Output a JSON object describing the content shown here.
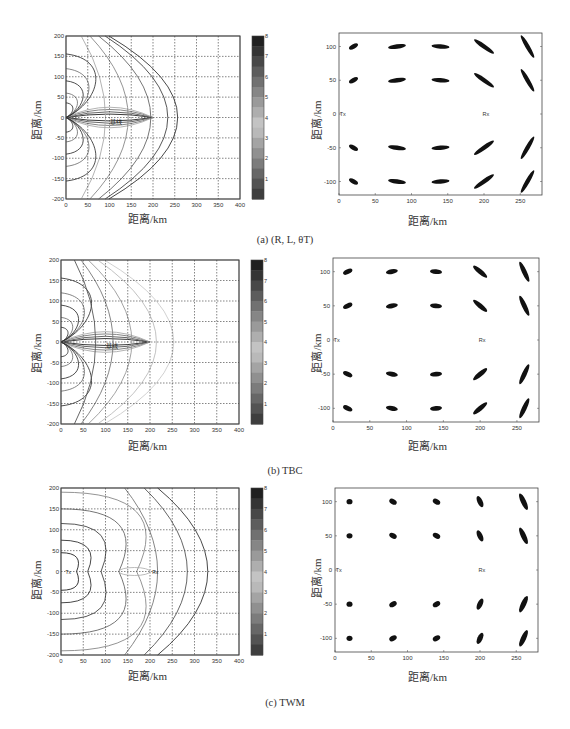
{
  "figure": {
    "rows": [
      {
        "caption": "(a) (R, L, θT)",
        "contour": {
          "xlabel": "距离/km",
          "ylabel": "距离/km",
          "center_label": "基线"
        },
        "scatter": {
          "xlabel": "距离/km",
          "ylabel": "距离/km",
          "tx_label": "Tx",
          "rx_label": "Rx"
        }
      },
      {
        "caption": "(b) TBC",
        "contour": {
          "xlabel": "距离/km",
          "ylabel": "距离/km",
          "center_label": "基线"
        },
        "scatter": {
          "xlabel": "距离/km",
          "ylabel": "距离/km",
          "tx_label": "Tx",
          "rx_label": "Rx"
        }
      },
      {
        "caption": "(c) TWM",
        "contour": {
          "xlabel": "距离/km",
          "ylabel": "距离/km",
          "center_label": "Tx Rx"
        },
        "scatter": {
          "xlabel": "距离/km",
          "ylabel": "距离/km",
          "tx_label": "Tx",
          "rx_label": "Rx"
        }
      }
    ]
  },
  "chart_data": [
    {
      "type": "contour",
      "title": "(a) (R, L, θT) contour",
      "xlabel": "距离/km",
      "ylabel": "距离/km",
      "xlim": [
        0,
        400
      ],
      "ylim": [
        -200,
        200
      ],
      "xticks": [
        0,
        50,
        100,
        150,
        200,
        250,
        300,
        350,
        400
      ],
      "yticks": [
        -200,
        -150,
        -100,
        -50,
        0,
        50,
        100,
        150,
        200
      ],
      "colorbar": {
        "range": [
          0,
          8
        ],
        "ticks": [
          1,
          2,
          3,
          4,
          5,
          6,
          7,
          8
        ]
      },
      "grid": true,
      "baseline": [
        [
          0,
          0
        ],
        [
          200,
          0
        ]
      ],
      "contour_labels": [
        5,
        6,
        8,
        10,
        15,
        20,
        25,
        30
      ]
    },
    {
      "type": "scatter",
      "title": "(a) (R, L, θT) error ellipses",
      "xlabel": "距离/km",
      "ylabel": "距离/km",
      "xlim": [
        0,
        280
      ],
      "ylim": [
        -120,
        120
      ],
      "xticks": [
        0,
        50,
        100,
        150,
        200,
        250
      ],
      "yticks": [
        -100,
        -50,
        0,
        50,
        100
      ],
      "tx": [
        0,
        0
      ],
      "rx": [
        200,
        0
      ],
      "clusters_x": [
        20,
        80,
        140,
        200,
        260
      ],
      "clusters_y": [
        100,
        50,
        -50,
        -100
      ]
    },
    {
      "type": "contour",
      "title": "(b) TBC contour",
      "xlabel": "距离/km",
      "ylabel": "距离/km",
      "xlim": [
        0,
        400
      ],
      "ylim": [
        -200,
        200
      ],
      "xticks": [
        0,
        50,
        100,
        150,
        200,
        250,
        300,
        350,
        400
      ],
      "yticks": [
        -200,
        -150,
        -100,
        -50,
        0,
        50,
        100,
        150,
        200
      ],
      "colorbar": {
        "range": [
          0,
          8
        ],
        "ticks": [
          1,
          2,
          3,
          4,
          5,
          6,
          7,
          8
        ]
      },
      "grid": true,
      "contour_labels": [
        1.5,
        2,
        2.5,
        3,
        4,
        5,
        6
      ]
    },
    {
      "type": "scatter",
      "title": "(b) TBC error ellipses",
      "xlabel": "距离/km",
      "ylabel": "距离/km",
      "xlim": [
        0,
        280
      ],
      "ylim": [
        -120,
        120
      ],
      "xticks": [
        0,
        50,
        100,
        150,
        200,
        250
      ],
      "yticks": [
        -100,
        -50,
        0,
        50,
        100
      ],
      "tx": [
        0,
        0
      ],
      "rx": [
        200,
        0
      ],
      "clusters_x": [
        20,
        80,
        140,
        200,
        260
      ],
      "clusters_y": [
        100,
        50,
        -50,
        -100
      ]
    },
    {
      "type": "contour",
      "title": "(c) TWM contour",
      "xlabel": "距离/km",
      "ylabel": "距离/km",
      "xlim": [
        0,
        400
      ],
      "ylim": [
        -200,
        200
      ],
      "xticks": [
        0,
        50,
        100,
        150,
        200,
        250,
        300,
        350,
        400
      ],
      "yticks": [
        -200,
        -150,
        -100,
        -50,
        0,
        50,
        100,
        150,
        200
      ],
      "colorbar": {
        "range": [
          0,
          8
        ],
        "ticks": [
          1,
          2,
          3,
          4,
          5,
          6,
          7,
          8
        ]
      },
      "grid": true,
      "contour_labels": [
        0.5,
        1,
        1.5,
        2,
        2.5,
        3,
        4,
        5
      ]
    },
    {
      "type": "scatter",
      "title": "(c) TWM error ellipses",
      "xlabel": "距离/km",
      "ylabel": "距离/km",
      "xlim": [
        0,
        280
      ],
      "ylim": [
        -120,
        120
      ],
      "xticks": [
        0,
        50,
        100,
        150,
        200,
        250
      ],
      "yticks": [
        -100,
        -50,
        0,
        50,
        100
      ],
      "tx": [
        0,
        0
      ],
      "rx": [
        200,
        0
      ],
      "clusters_x": [
        20,
        80,
        140,
        200,
        260
      ],
      "clusters_y": [
        100,
        50,
        -50,
        -100
      ]
    }
  ]
}
